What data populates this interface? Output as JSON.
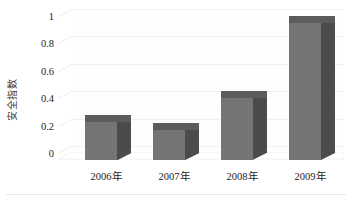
{
  "chart_data": {
    "type": "bar",
    "title": "",
    "subtitle": "",
    "xlabel": "",
    "ylabel": "安全指数",
    "categories": [
      "2006年",
      "2007年",
      "2008年",
      "2009年"
    ],
    "values": [
      0.28,
      0.22,
      0.45,
      1.0
    ],
    "series": [
      {
        "name": "安全指数",
        "values": [
          0.28,
          0.22,
          0.45,
          1.0
        ]
      }
    ],
    "ylim": [
      0,
      1
    ],
    "xlim_categories": 4,
    "y_ticks": [
      0,
      0.2,
      0.4,
      0.6,
      0.8,
      1
    ],
    "y_tick_labels": [
      "0",
      "0.2",
      "0.4",
      "0.6",
      "0.8",
      "1"
    ],
    "grid": true,
    "grid_axis": "y",
    "legend": false,
    "legend_position": "none",
    "three_d": true,
    "annotations": []
  },
  "style": {
    "bar_front_color": "#757575",
    "bar_side_color": "#4b4b4b",
    "bar_top_color": "#5c5c5c",
    "gridline_color": "#f0f0f0",
    "text_color": "#1d1d1d",
    "axis_title_color": "#3a3a3a",
    "background_color": "#ffffff"
  }
}
